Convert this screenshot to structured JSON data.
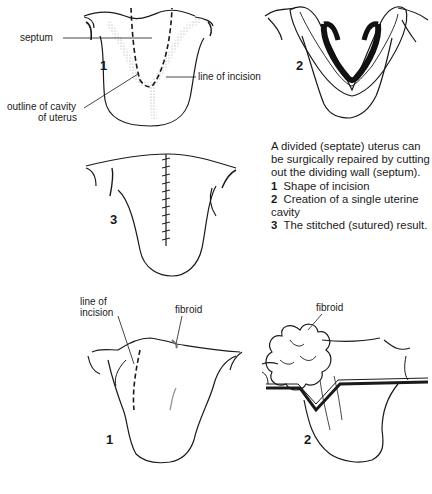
{
  "figure_top": {
    "panel_1": {
      "number": "1",
      "labels": {
        "septum": "septum",
        "line_of_incision": "line of incision",
        "outline_cavity_line1": "outline of cavity",
        "outline_cavity_line2": "of uterus"
      }
    },
    "panel_2": {
      "number": "2"
    },
    "panel_3": {
      "number": "3"
    }
  },
  "caption": {
    "intro": "A divided (septate) uterus can be surgically repaired by cutting out the dividing wall (septum).",
    "items": [
      {
        "num": "1",
        "text": "Shape of incision"
      },
      {
        "num": "2",
        "text": "Creation of a single uterine cavity"
      },
      {
        "num": "3",
        "text": "The stitched (sutured) result."
      }
    ]
  },
  "figure_bottom": {
    "panel_1": {
      "number": "1",
      "labels": {
        "line_of_incision_line1": "line of",
        "line_of_incision_line2": "incision",
        "fibroid": "fibroid"
      }
    },
    "panel_2": {
      "number": "2",
      "labels": {
        "fibroid": "fibroid"
      }
    }
  },
  "colors": {
    "ink": "#1a1a1a",
    "stipple": "#b5b5b5",
    "background": "#ffffff"
  }
}
